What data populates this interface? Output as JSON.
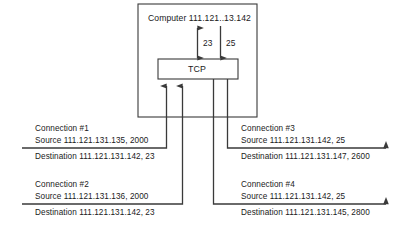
{
  "diagram": {
    "title_box": {
      "label": "Computer 111.121..13.142"
    },
    "protocol_box": {
      "label": "TCP"
    },
    "ports": [
      {
        "name": "port-23",
        "label": "23",
        "direction": "bidirectional"
      },
      {
        "name": "port-25",
        "label": "25",
        "direction": "down"
      }
    ],
    "connections": [
      {
        "id": "connection-1",
        "title": "Connection #1",
        "source": "Source 111.121.131.135, 2000",
        "destination": "Destination 111.121.131.142, 23",
        "side": "left",
        "direction": "inbound"
      },
      {
        "id": "connection-2",
        "title": "Connection #2",
        "source": "Source 111.121.131.136, 2000",
        "destination": "Destination 111.121.131.142, 23",
        "side": "left",
        "direction": "inbound"
      },
      {
        "id": "connection-3",
        "title": "Connection #3",
        "source": "Source 111.121.131.142, 25",
        "destination": "Destination 111.121.131.147, 2600",
        "side": "right",
        "direction": "outbound"
      },
      {
        "id": "connection-4",
        "title": "Connection #4",
        "source": "Source 111.121.131.142, 25",
        "destination": "Destination 111.121.131.145, 2800",
        "side": "right",
        "direction": "outbound"
      }
    ],
    "colors": {
      "stroke": "#3a3a3a",
      "text": "#1a1a1a",
      "background": "#ffffff"
    }
  }
}
